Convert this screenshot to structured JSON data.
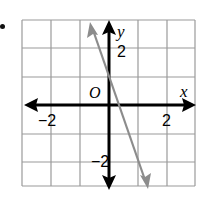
{
  "figure": {
    "item_marker": ".",
    "axes": {
      "x_label": "x",
      "y_label": "y",
      "origin_label": "O",
      "x_ticks": [
        {
          "value": -2,
          "label": "−2"
        },
        {
          "value": 2,
          "label": "2"
        }
      ],
      "y_ticks": [
        {
          "value": 2,
          "label": "2"
        },
        {
          "value": -2,
          "label": "−2"
        }
      ],
      "range": {
        "x": [
          -3,
          3
        ],
        "y": [
          -3,
          3
        ]
      }
    },
    "line": {
      "equation": "y = -3x + 1",
      "color": "#8c8c8c",
      "from": [
        -0.67,
        3
      ],
      "to": [
        1.33,
        -3
      ]
    },
    "colors": {
      "grid": "#9a9a9a",
      "axes": "#000000",
      "line": "#8c8c8c"
    }
  }
}
